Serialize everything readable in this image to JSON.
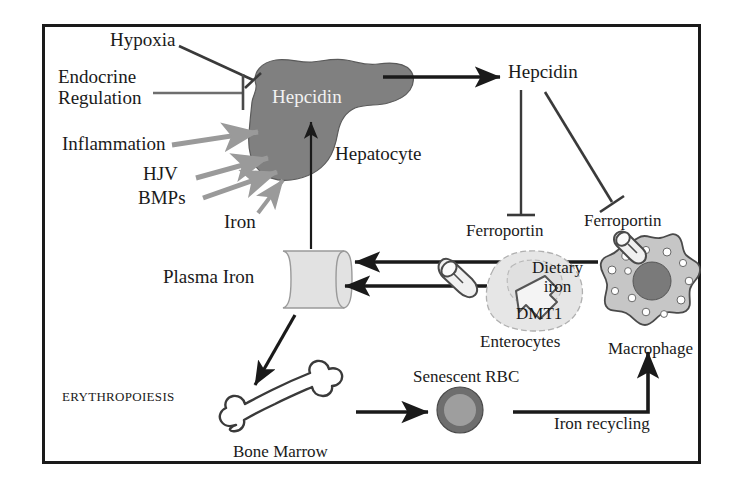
{
  "figure": {
    "border_color": "#1a1a1a",
    "organ_fill": "#808080",
    "cell_fill": "#d9d9d9",
    "arrow_color": "#1a1a1a",
    "gray_arrow_color": "#9a9a9a"
  },
  "regulators": {
    "hypoxia": "Hypoxia",
    "endocrine_line1": "Endocrine",
    "endocrine_line2": "Regulation",
    "inflammation": "Inflammation",
    "hjv": "HJV",
    "bmps": "BMPs",
    "iron": "Iron"
  },
  "liver": {
    "hepcidin_label": "Hepcidin",
    "hepatocyte_label": "Hepatocyte"
  },
  "circulating": {
    "hepcidin_label": "Hepcidin",
    "ferroportin_enterocyte": "Ferroportin",
    "ferroportin_macrophage": "Ferroportin"
  },
  "plasma": {
    "label": "Plasma Iron"
  },
  "enterocyte": {
    "label": "Enterocytes",
    "dietary_line1": "Dietary",
    "dietary_line2": "iron",
    "transporter": "DMT1"
  },
  "macrophage": {
    "label": "Macrophage"
  },
  "erythropoiesis": {
    "label": "ERYTHROPOIESIS",
    "bone_marrow": "Bone Marrow",
    "senescent_rbc": "Senescent RBC",
    "iron_recycling": "Iron recycling"
  },
  "icons": {
    "inhibition": "t-bar-inhibition-icon",
    "stimulation": "arrow-stimulation-icon",
    "channel": "ferroportin-channel-icon",
    "liver": "liver-organ-icon",
    "bone": "bone-icon",
    "rbc": "red-blood-cell-icon",
    "macrophage": "macrophage-cell-icon",
    "enterocyte": "enterocyte-cell-icon",
    "plasma": "plasma-tube-icon"
  }
}
